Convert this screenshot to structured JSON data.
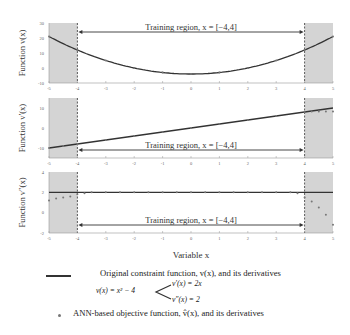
{
  "chart_data": [
    {
      "type": "line",
      "title": "",
      "ylabel": "Function v(x)",
      "xlabel": "",
      "xlim": [
        -5,
        5
      ],
      "ylim": [
        -10,
        30
      ],
      "xticks": [
        "-5",
        "-4",
        "-3",
        "-2",
        "-1",
        "0",
        "1",
        "2",
        "3",
        "4",
        "5"
      ],
      "yticks": [
        "-10",
        "0",
        "10",
        "20",
        "30"
      ],
      "annotation": "Training region, x = [−4,4]",
      "shaded_regions": [
        [
          -5,
          -4
        ],
        [
          4,
          5
        ]
      ],
      "series": [
        {
          "name": "Original constraint function v(x) = x^2 - 4",
          "style": "line",
          "x": [
            -5,
            -4,
            -3,
            -2,
            -1,
            0,
            1,
            2,
            3,
            4,
            5
          ],
          "values": [
            21,
            12,
            5,
            0,
            -3,
            -4,
            -3,
            0,
            5,
            12,
            21
          ]
        },
        {
          "name": "ANN-based objective function",
          "style": "markers",
          "x": [
            -5,
            -4,
            -3,
            -2,
            -1,
            0,
            1,
            2,
            3,
            4,
            5
          ],
          "values": [
            21,
            12,
            5,
            0,
            -3,
            -4,
            -3,
            0,
            5,
            12,
            21
          ]
        }
      ]
    },
    {
      "type": "line",
      "ylabel": "Function v'(x)",
      "xlim": [
        -5,
        5
      ],
      "ylim": [
        -15,
        15
      ],
      "xticks": [
        "-5",
        "-4",
        "-3",
        "-2",
        "-1",
        "0",
        "1",
        "2",
        "3",
        "4",
        "5"
      ],
      "yticks": [
        "-10",
        "0",
        "10"
      ],
      "annotation": "Training region, x = [−4,4]",
      "shaded_regions": [
        [
          -5,
          -4
        ],
        [
          4,
          5
        ]
      ],
      "series": [
        {
          "name": "v'(x) = 2x",
          "style": "line",
          "x": [
            -5,
            -4,
            -3,
            -2,
            -1,
            0,
            1,
            2,
            3,
            4,
            5
          ],
          "values": [
            -10,
            -8,
            -6,
            -4,
            -2,
            0,
            2,
            4,
            6,
            8,
            10
          ]
        },
        {
          "name": "ANN derivative",
          "style": "markers",
          "x": [
            -5,
            -4.5,
            -4,
            -3,
            -2,
            -1,
            0,
            1,
            2,
            3,
            4,
            4.25,
            4.5,
            4.75,
            5
          ],
          "values": [
            -10,
            -9,
            -8,
            -6,
            -4,
            -2,
            0,
            2,
            4,
            6,
            8,
            8.2,
            8.3,
            8.3,
            8.2
          ]
        }
      ]
    },
    {
      "type": "scatter",
      "ylabel": "Function v''(x)",
      "xlabel": "Variable x",
      "xlim": [
        -5,
        5
      ],
      "ylim": [
        -2,
        4
      ],
      "xticks": [
        "-5",
        "-4",
        "-3",
        "-2",
        "-1",
        "0",
        "1",
        "2",
        "3",
        "4",
        "5"
      ],
      "yticks": [
        "-2",
        "0",
        "2",
        "4"
      ],
      "annotation": "Training region, x = [−4,4]",
      "shaded_regions": [
        [
          -5,
          -4
        ],
        [
          4,
          5
        ]
      ],
      "series": [
        {
          "name": "v''(x) = 2",
          "style": "line",
          "x": [
            -5,
            5
          ],
          "values": [
            2,
            2
          ]
        },
        {
          "name": "ANN second derivative",
          "style": "markers",
          "x": [
            -5,
            -4.75,
            -4.5,
            -4.25,
            -4,
            -3.75,
            -3.5,
            -3,
            -2.5,
            -2,
            -1.5,
            -1,
            -0.5,
            0,
            0.5,
            1,
            1.5,
            2,
            2.5,
            3,
            3.5,
            3.75,
            4,
            4.25,
            4.5,
            4.75,
            5
          ],
          "values": [
            1.2,
            1.4,
            1.5,
            1.6,
            1.8,
            1.9,
            2,
            2,
            2,
            2,
            2,
            2,
            2,
            2,
            2,
            2,
            2,
            2,
            2,
            2,
            2,
            1.9,
            1.5,
            1.1,
            0.5,
            -0.2,
            -1.2
          ]
        }
      ]
    }
  ],
  "xlabel": "Variable x",
  "ylabels": [
    "Function v(x)",
    "Function v′(x)",
    "Function v″(x)"
  ],
  "annotation": "Training region, x = [−4,4]",
  "legend": {
    "line_label": "Original constraint function, v(x), and its derivatives",
    "eq_main": "v(x) = x² − 4",
    "eq_d1": "v′(x) = 2x",
    "eq_d2": "v″(x) = 2",
    "marker_label": "ANN-based objective function, v̂(x), and its derivatives"
  },
  "colors": {
    "shade": "#d4d4d4",
    "line": "#333333",
    "marker": "#777777"
  }
}
